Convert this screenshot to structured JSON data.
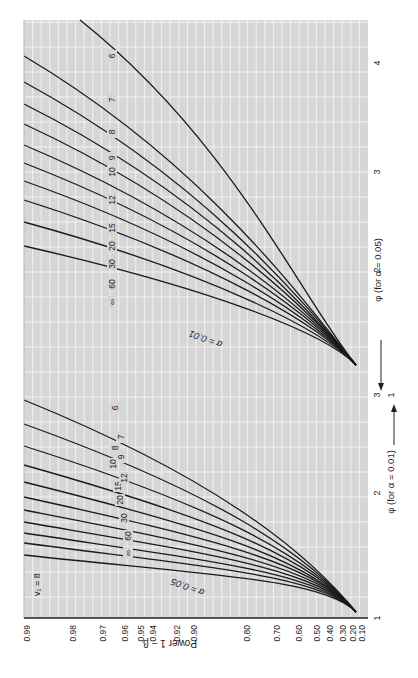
{
  "chart_data": {
    "type": "line",
    "numerator_df_label": "v₁ = 8",
    "orientation": "rotated 90° counter-clockwise (x-axis runs vertically along right edge, y-axis along bottom edge)",
    "ylabel": "Power 1 − β",
    "y_ticks": [
      "0.10",
      "0.20",
      "0.30",
      "0.40",
      "0.50",
      "0.60",
      "0.70",
      "0.80",
      "0.90",
      "0.92",
      "0.94",
      "0.95",
      "0.96",
      "0.97",
      "0.98",
      "0.99"
    ],
    "xlabel_lower": "φ (for α = 0.01)",
    "xlabel_upper": "φ (for α = 0.05)",
    "x_ticks_lower": [
      "1",
      "2",
      "3"
    ],
    "x_ticks_upper": [
      "1",
      "2",
      "3",
      "4"
    ],
    "axis_arrow_lower": "→",
    "axis_arrow_upper": "←",
    "grid": true,
    "families": [
      {
        "name": "α = 0.05",
        "phi_range": [
          1,
          3
        ],
        "curve_labels": [
          "∞",
          "60",
          "30",
          "20",
          "15",
          "12",
          "10",
          "9",
          "8",
          "7",
          "6"
        ],
        "denominator_df_label": "v₂ = ∞"
      },
      {
        "name": "α = 0.01",
        "phi_range": [
          2,
          4.4
        ],
        "curve_labels": [
          "∞",
          "60",
          "30",
          "20",
          "15",
          "12",
          "10",
          "9",
          "8",
          "7",
          "6"
        ]
      }
    ]
  }
}
